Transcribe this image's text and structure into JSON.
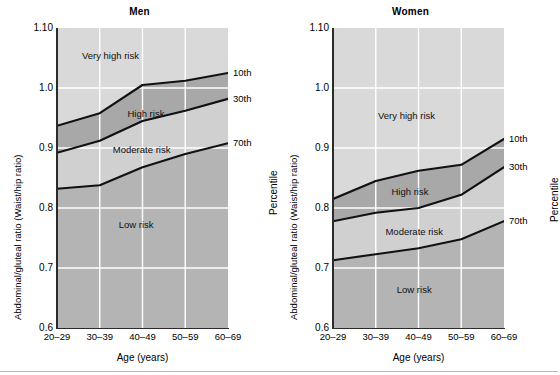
{
  "figure": {
    "background": "#ffffff",
    "axis_color": "#2b2b2b",
    "gridline_color": "#ffffff",
    "band_colors": {
      "very_high_risk": "#d9d9d9",
      "high_risk": "#a8a8a8",
      "moderate_risk": "#d0d0d0",
      "low_risk": "#b4b4b4"
    }
  },
  "panels": [
    {
      "key": "men",
      "title": "Men",
      "ylabel": "Abdominal/gluteal ratio (Waist/hip ratio)",
      "xlabel": "Age (years)",
      "right_axis_label": "Percentile",
      "yticks": [
        "1.10",
        "1.0",
        "0.9",
        "0.8",
        "0.7",
        "0.6"
      ],
      "ytick_values": [
        1.1,
        1.0,
        0.9,
        0.8,
        0.7,
        0.6
      ],
      "xticks": [
        "20–29",
        "30–39",
        "40–49",
        "50–59",
        "60–69"
      ],
      "percentile_labels": [
        "10th",
        "30th",
        "70th"
      ],
      "region_labels": [
        {
          "text": "Very high risk",
          "x": 1.25,
          "y": 1.055
        },
        {
          "text": "High risk",
          "x": 2.08,
          "y": 0.958
        },
        {
          "text": "Moderate risk",
          "x": 1.98,
          "y": 0.898
        },
        {
          "text": "Low risk",
          "x": 1.85,
          "y": 0.773
        }
      ]
    },
    {
      "key": "women",
      "title": "Women",
      "ylabel": "Abdominal/gluteal ratio (Waist/hip ratio)",
      "xlabel": "Age (years)",
      "right_axis_label": "Percentile",
      "yticks": [
        "1.10",
        "1.0",
        "0.9",
        "0.8",
        "0.7",
        "0.6"
      ],
      "ytick_values": [
        1.1,
        1.0,
        0.9,
        0.8,
        0.7,
        0.6
      ],
      "xticks": [
        "20–29",
        "30–39",
        "40–49",
        "50–59",
        "60–69"
      ],
      "percentile_labels": [
        "10th",
        "30th",
        "70th"
      ],
      "region_labels": [
        {
          "text": "Very high risk",
          "x": 1.72,
          "y": 0.955
        },
        {
          "text": "High risk",
          "x": 1.8,
          "y": 0.828
        },
        {
          "text": "Moderate risk",
          "x": 1.9,
          "y": 0.762
        },
        {
          "text": "Low risk",
          "x": 1.9,
          "y": 0.665
        }
      ]
    }
  ],
  "chart_data": [
    {
      "type": "line",
      "title": "Men",
      "xlabel": "Age (years)",
      "ylabel": "Abdominal/gluteal ratio (Waist/hip ratio)",
      "right_ylabel": "Percentile",
      "categories": [
        "20–29",
        "30–39",
        "40–49",
        "50–59",
        "60–69"
      ],
      "ylim": [
        0.6,
        1.1
      ],
      "ytick_values": [
        1.1,
        1.0,
        0.9,
        0.8,
        0.7,
        0.6
      ],
      "grid": true,
      "legend": "right-axis-percentile-annotations",
      "series": [
        {
          "name": "10th",
          "values": [
            0.937,
            0.958,
            1.005,
            1.012,
            1.025
          ]
        },
        {
          "name": "30th",
          "values": [
            0.892,
            0.912,
            0.945,
            0.962,
            0.982
          ]
        },
        {
          "name": "70th",
          "values": [
            0.832,
            0.838,
            0.868,
            0.89,
            0.908
          ]
        }
      ],
      "regions": [
        {
          "name": "Very high risk",
          "above": "10th"
        },
        {
          "name": "High risk",
          "between": [
            "10th",
            "30th"
          ]
        },
        {
          "name": "Moderate risk",
          "between": [
            "30th",
            "70th"
          ]
        },
        {
          "name": "Low risk",
          "below": "70th"
        }
      ]
    },
    {
      "type": "line",
      "title": "Women",
      "xlabel": "Age (years)",
      "ylabel": "Abdominal/gluteal ratio (Waist/hip ratio)",
      "right_ylabel": "Percentile",
      "categories": [
        "20–29",
        "30–39",
        "40–49",
        "50–59",
        "60–69"
      ],
      "ylim": [
        0.6,
        1.1
      ],
      "ytick_values": [
        1.1,
        1.0,
        0.9,
        0.8,
        0.7,
        0.6
      ],
      "grid": true,
      "legend": "right-axis-percentile-annotations",
      "series": [
        {
          "name": "10th",
          "values": [
            0.815,
            0.845,
            0.862,
            0.872,
            0.915
          ]
        },
        {
          "name": "30th",
          "values": [
            0.778,
            0.792,
            0.8,
            0.822,
            0.868
          ]
        },
        {
          "name": "70th",
          "values": [
            0.713,
            0.723,
            0.733,
            0.748,
            0.778
          ]
        }
      ],
      "regions": [
        {
          "name": "Very high risk",
          "above": "10th"
        },
        {
          "name": "High risk",
          "between": [
            "10th",
            "30th"
          ]
        },
        {
          "name": "Moderate risk",
          "between": [
            "30th",
            "70th"
          ]
        },
        {
          "name": "Low risk",
          "below": "70th"
        }
      ]
    }
  ]
}
